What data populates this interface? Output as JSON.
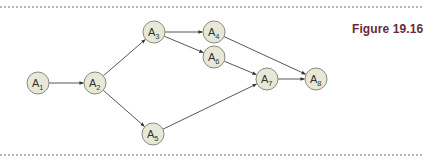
{
  "figure": {
    "label": "Figure 19.16",
    "label_color": "#6b2a3a"
  },
  "graph": {
    "node_fill": "#e7e8d6",
    "node_stroke": "#8a8a80",
    "node_radius": 11,
    "nodes": [
      {
        "id": "A1",
        "base": "A",
        "sub": "1",
        "x": 38,
        "y": 83
      },
      {
        "id": "A2",
        "base": "A",
        "sub": "2",
        "x": 95,
        "y": 83
      },
      {
        "id": "A3",
        "base": "A",
        "sub": "3",
        "x": 154,
        "y": 32
      },
      {
        "id": "A4",
        "base": "A",
        "sub": "4",
        "x": 214,
        "y": 32
      },
      {
        "id": "A5",
        "base": "A",
        "sub": "5",
        "x": 153,
        "y": 134
      },
      {
        "id": "A6",
        "base": "A",
        "sub": "6",
        "x": 214,
        "y": 57
      },
      {
        "id": "A7",
        "base": "A",
        "sub": "7",
        "x": 267,
        "y": 79
      },
      {
        "id": "A8",
        "base": "A",
        "sub": "8",
        "x": 316,
        "y": 79
      }
    ],
    "edges": [
      {
        "from": "A1",
        "to": "A2"
      },
      {
        "from": "A2",
        "to": "A3"
      },
      {
        "from": "A2",
        "to": "A5"
      },
      {
        "from": "A3",
        "to": "A4"
      },
      {
        "from": "A3",
        "to": "A6"
      },
      {
        "from": "A4",
        "to": "A8"
      },
      {
        "from": "A6",
        "to": "A7"
      },
      {
        "from": "A5",
        "to": "A7"
      },
      {
        "from": "A7",
        "to": "A8"
      }
    ]
  }
}
